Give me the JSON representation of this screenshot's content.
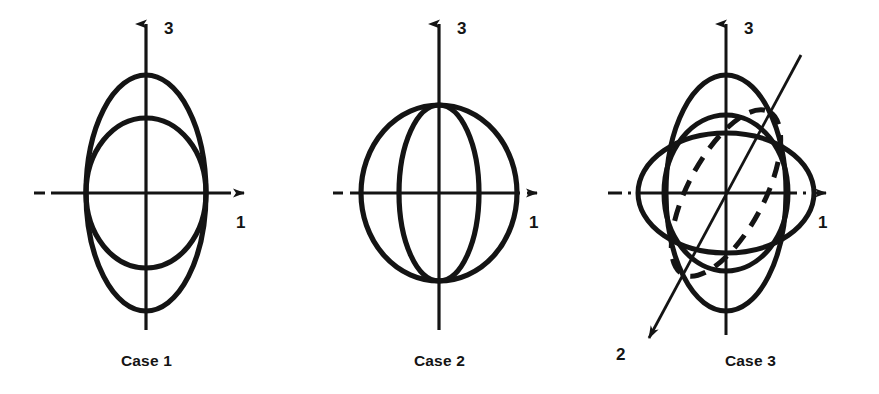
{
  "figure": {
    "background_color": "#ffffff",
    "stroke_color": "#141414",
    "panel_count": 3
  },
  "panels": [
    {
      "id": "case-1",
      "caption": "Case 1",
      "axes": [
        {
          "name": "axis-3",
          "label": "3",
          "direction": "up",
          "arrow": true,
          "style": "solid"
        },
        {
          "name": "axis-1",
          "label": "1",
          "direction": "right",
          "arrow": true,
          "style": "dashed-ends"
        }
      ],
      "shapes": [
        {
          "name": "tall-ellipse",
          "type": "ellipse",
          "rx": 60,
          "ry": 118,
          "rotation": 0,
          "dashed": false
        },
        {
          "name": "circle",
          "type": "ellipse",
          "rx": 60,
          "ry": 75,
          "rotation": 0,
          "dashed": false
        }
      ]
    },
    {
      "id": "case-2",
      "caption": "Case 2",
      "axes": [
        {
          "name": "axis-3",
          "label": "3",
          "direction": "up",
          "arrow": true,
          "style": "solid"
        },
        {
          "name": "axis-1",
          "label": "1",
          "direction": "right",
          "arrow": true,
          "style": "dashed-ends"
        }
      ],
      "shapes": [
        {
          "name": "outer-circle",
          "type": "ellipse",
          "rx": 78,
          "ry": 88,
          "rotation": 0,
          "dashed": false
        },
        {
          "name": "meridian-ellipse",
          "type": "ellipse",
          "rx": 40,
          "ry": 88,
          "rotation": 0,
          "dashed": false
        }
      ]
    },
    {
      "id": "case-3",
      "caption": "Case 3",
      "axes": [
        {
          "name": "axis-3",
          "label": "3",
          "direction": "up",
          "arrow": true,
          "style": "solid"
        },
        {
          "name": "axis-1",
          "label": "1",
          "direction": "right",
          "arrow": true,
          "style": "dashed-ends"
        },
        {
          "name": "axis-2",
          "label": "2",
          "direction": "down-left",
          "arrow": true,
          "style": "solid"
        }
      ],
      "shapes": [
        {
          "name": "tall-ellipse",
          "type": "ellipse",
          "rx": 60,
          "ry": 118,
          "rotation": 0,
          "dashed": false
        },
        {
          "name": "circle",
          "type": "ellipse",
          "rx": 62,
          "ry": 78,
          "rotation": 0,
          "dashed": false
        },
        {
          "name": "wide-ellipse",
          "type": "ellipse",
          "rx": 88,
          "ry": 60,
          "rotation": 0,
          "dashed": false
        },
        {
          "name": "tilted-ellipse-front",
          "type": "ellipse",
          "rx": 92,
          "ry": 38,
          "rotation": -62,
          "dashed": false
        },
        {
          "name": "tilted-ellipse-back",
          "type": "ellipse",
          "rx": 92,
          "ry": 38,
          "rotation": -62,
          "dashed": true
        }
      ]
    }
  ]
}
